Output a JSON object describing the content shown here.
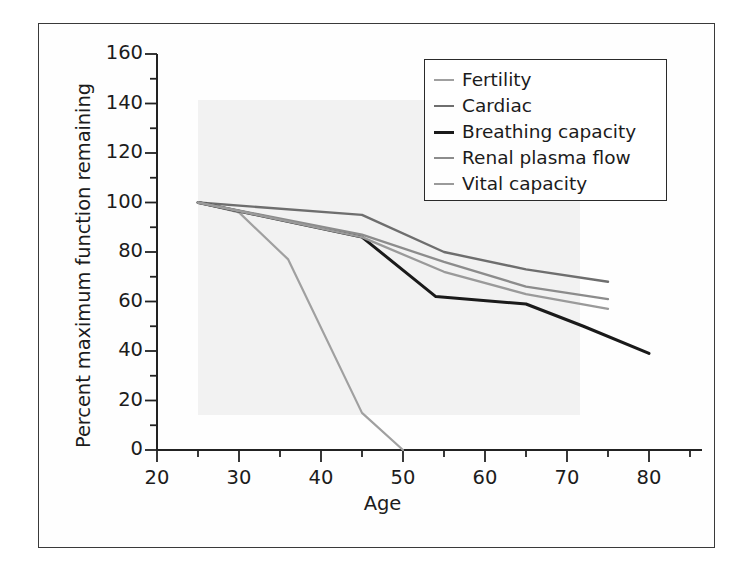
{
  "figure": {
    "has_outer_border": true,
    "background_color": "#ffffff",
    "border_color": "#3a3a3a"
  },
  "chart_data": {
    "type": "line",
    "title": "",
    "xlabel": "Age",
    "ylabel": "Percent maximum function remaining",
    "xlim": [
      20,
      85
    ],
    "ylim": [
      0,
      160
    ],
    "xticks": [
      20,
      30,
      40,
      50,
      60,
      70,
      80
    ],
    "xtick_labels": [
      "20",
      "30",
      "40",
      "50",
      "60",
      "70",
      "80"
    ],
    "xminor_step": 5,
    "yticks": [
      0,
      20,
      40,
      60,
      80,
      100,
      120,
      140,
      160
    ],
    "ytick_labels": [
      "0",
      "20",
      "40",
      "60",
      "80",
      "100",
      "120",
      "140",
      "160"
    ],
    "yminor_step": 10,
    "grid": false,
    "legend_position": "upper right",
    "series": [
      {
        "name": "Fertility",
        "color": "#a0a0a0",
        "width": 2.2,
        "x": [
          25,
          30,
          36,
          45,
          50
        ],
        "y": [
          100,
          96,
          77,
          15,
          0
        ]
      },
      {
        "name": "Cardiac",
        "color": "#6e6e6e",
        "width": 2.4,
        "x": [
          25,
          45,
          55,
          65,
          75
        ],
        "y": [
          100,
          95,
          80,
          73,
          68
        ]
      },
      {
        "name": "Breathing capacity",
        "color": "#1a1a1a",
        "width": 3.0,
        "x": [
          25,
          45,
          54,
          65,
          72,
          80
        ],
        "y": [
          100,
          86,
          62,
          59,
          50,
          39
        ]
      },
      {
        "name": "Renal plasma flow",
        "color": "#8c8c8c",
        "width": 2.3,
        "x": [
          25,
          45,
          55,
          65,
          75
        ],
        "y": [
          100,
          87,
          76,
          66,
          61
        ]
      },
      {
        "name": "Vital capacity",
        "color": "#9a9a9a",
        "width": 2.3,
        "x": [
          25,
          45,
          55,
          65,
          75
        ],
        "y": [
          100,
          86,
          72,
          63,
          57
        ]
      }
    ]
  },
  "legend": {
    "items": [
      {
        "label": "Fertility"
      },
      {
        "label": "Cardiac"
      },
      {
        "label": "Breathing capacity"
      },
      {
        "label": "Renal plasma flow"
      },
      {
        "label": "Vital capacity"
      }
    ]
  }
}
